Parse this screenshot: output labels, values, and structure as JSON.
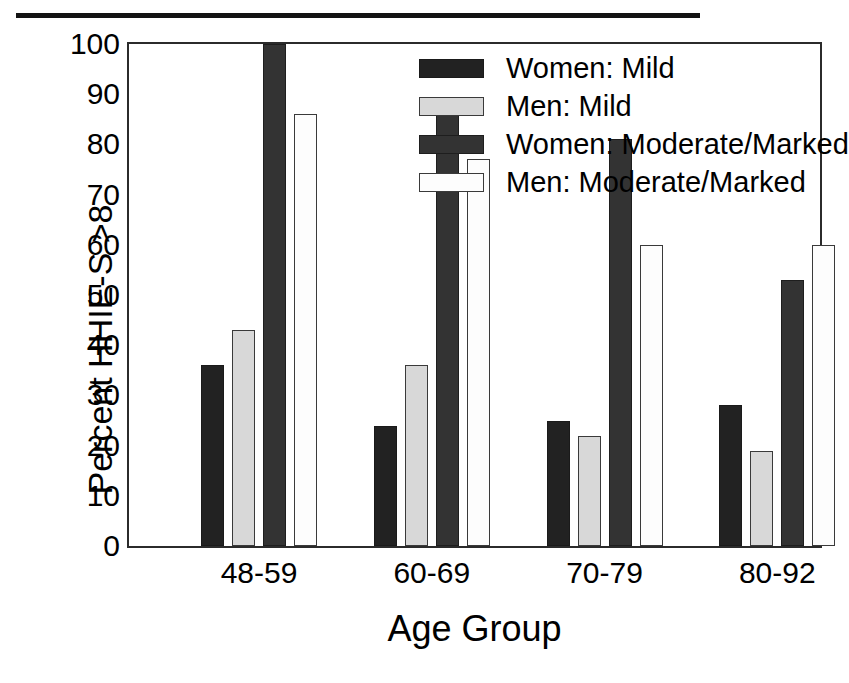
{
  "chart_data": {
    "type": "bar",
    "title": "",
    "xlabel": "Age Group",
    "ylabel": "Percent HHIE-S >8",
    "categories": [
      "48-59",
      "60-69",
      "70-79",
      "80-92"
    ],
    "ylim": [
      0,
      100
    ],
    "yticks": [
      0,
      10,
      20,
      30,
      40,
      50,
      60,
      70,
      80,
      90,
      100
    ],
    "ytick_labels": [
      "0",
      "10",
      "20",
      "30",
      "40",
      "50",
      "60",
      "70",
      "80",
      "90",
      "100"
    ],
    "grid": false,
    "legend_position": "top-right-inside",
    "series": [
      {
        "name": "Women: Mild",
        "swatch": "fill-black",
        "color": "#222222",
        "values": [
          36,
          24,
          25,
          28
        ]
      },
      {
        "name": "Men: Mild",
        "swatch": "fill-lgray",
        "color": "#d8d8d8",
        "values": [
          43,
          36,
          22,
          19
        ]
      },
      {
        "name": "Women: Moderate/Marked",
        "swatch": "fill-dgray",
        "color": "#333333",
        "values": [
          100,
          86,
          81,
          53
        ]
      },
      {
        "name": "Men: Moderate/Marked",
        "swatch": "fill-white",
        "color": "#fdfdfd",
        "values": [
          86,
          77,
          60,
          60
        ]
      }
    ]
  },
  "axes": {
    "y_title": "Percent HHIE-S >8",
    "x_title": "Age Group"
  },
  "legend": {
    "items": [
      {
        "label": "Women: Mild"
      },
      {
        "label": "Men: Mild"
      },
      {
        "label": "Women: Moderate/Marked"
      },
      {
        "label": "Men: Moderate/Marked"
      }
    ]
  }
}
